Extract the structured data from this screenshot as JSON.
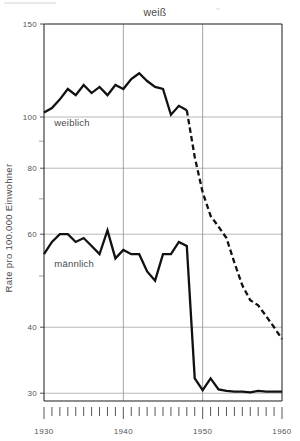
{
  "chart_data": {
    "type": "line",
    "title": "weiß",
    "xlabel": "",
    "ylabel": "Rate pro 100.000 Einwohner",
    "yscale": "log",
    "ylim": [
      29,
      150
    ],
    "xlim": [
      1930,
      1960
    ],
    "grid": true,
    "legend_position": "inline-annotations",
    "y_ticks": [
      150,
      100,
      80,
      60,
      40,
      30
    ],
    "y_tick_labels": [
      "150",
      "100",
      "80",
      "60",
      "40",
      "30"
    ],
    "y_minor_ticks": [
      90,
      70,
      50
    ],
    "x_ticks": [
      1930,
      1940,
      1950,
      1960
    ],
    "x_tick_labels": [
      "1930",
      "1940",
      "1950",
      "1960"
    ],
    "x_minor_tick_step": 1,
    "annotations": [
      {
        "name": "weiblich",
        "text": "weiblich",
        "x": 1931.3,
        "y": 96.0
      },
      {
        "name": "maennlich",
        "text": "männlich",
        "x": 1931.3,
        "y": 52.0
      }
    ],
    "series": [
      {
        "name": "weiblich",
        "label": "weiblich",
        "style": "solid-then-dashed",
        "dash_starts_at": 1948,
        "x": [
          1930,
          1931,
          1932,
          1933,
          1934,
          1935,
          1936,
          1937,
          1938,
          1939,
          1940,
          1941,
          1942,
          1943,
          1944,
          1945,
          1946,
          1947,
          1948,
          1949,
          1950,
          1951,
          1952,
          1953,
          1954,
          1955,
          1956,
          1957,
          1958,
          1959,
          1960
        ],
        "values": [
          102,
          104,
          108,
          113,
          110,
          115,
          111,
          114,
          110,
          115,
          113,
          118,
          121,
          117,
          114,
          113,
          101,
          105,
          103,
          84,
          72,
          65,
          62,
          59,
          53,
          48,
          45,
          44,
          42,
          40,
          38
        ]
      },
      {
        "name": "männlich",
        "label": "männlich",
        "style": "solid",
        "x": [
          1930,
          1931,
          1932,
          1933,
          1934,
          1935,
          1936,
          1937,
          1938,
          1939,
          1940,
          1941,
          1942,
          1943,
          1944,
          1945,
          1946,
          1947,
          1948,
          1949,
          1950,
          1951,
          1952,
          1953,
          1954,
          1955,
          1956,
          1957,
          1958,
          1959,
          1960
        ],
        "values": [
          55,
          58,
          60,
          60,
          58,
          59,
          57,
          55,
          61,
          54,
          56,
          55,
          55,
          51,
          49,
          55,
          55,
          58,
          57,
          32,
          30.4,
          32,
          30.5,
          30.3,
          30.2,
          30.2,
          30.1,
          30.3,
          30.2,
          30.2,
          30.2
        ]
      }
    ]
  },
  "colors": {
    "line": "#111111",
    "grid": "#9a9a9a",
    "frame": "#1a1a1a",
    "text": "#4a4a4a",
    "background": "#ffffff"
  }
}
